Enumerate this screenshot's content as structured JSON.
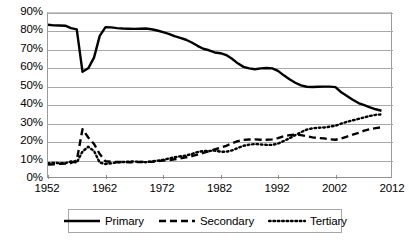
{
  "chart_data": {
    "type": "line",
    "title": "",
    "subtitle": "",
    "xlabel": "",
    "ylabel": "",
    "xlim": [
      1952,
      2012
    ],
    "ylim": [
      0,
      0.9
    ],
    "grid": true,
    "grid_axis": "y",
    "legend_position": "bottom",
    "y_tick_labels": [
      "90%",
      "80%",
      "70%",
      "60%",
      "50%",
      "40%",
      "30%",
      "20%",
      "10%",
      "0%"
    ],
    "y_tick_values": [
      0.9,
      0.8,
      0.7,
      0.6,
      0.5,
      0.4,
      0.3,
      0.2,
      0.1,
      0.0
    ],
    "x_tick_labels": [
      "1952",
      "1962",
      "1972",
      "1982",
      "1992",
      "2002",
      "2012"
    ],
    "x_tick_values": [
      1952,
      1962,
      1972,
      1982,
      1992,
      2002,
      2012
    ],
    "x": [
      1952,
      1953,
      1954,
      1955,
      1956,
      1957,
      1958,
      1959,
      1960,
      1961,
      1962,
      1963,
      1964,
      1965,
      1966,
      1967,
      1968,
      1969,
      1970,
      1971,
      1972,
      1973,
      1974,
      1975,
      1976,
      1977,
      1978,
      1979,
      1980,
      1981,
      1982,
      1983,
      1984,
      1985,
      1986,
      1987,
      1988,
      1989,
      1990,
      1991,
      1992,
      1993,
      1994,
      1995,
      1996,
      1997,
      1998,
      1999,
      2000,
      2001,
      2002,
      2003,
      2004,
      2005,
      2006,
      2007,
      2008,
      2009,
      2010
    ],
    "series": [
      {
        "name": "Primary",
        "style": "solid",
        "color": "#000000",
        "values": [
          0.836,
          0.833,
          0.832,
          0.831,
          0.818,
          0.811,
          0.581,
          0.6,
          0.658,
          0.776,
          0.823,
          0.822,
          0.818,
          0.816,
          0.815,
          0.814,
          0.815,
          0.816,
          0.812,
          0.805,
          0.796,
          0.787,
          0.775,
          0.765,
          0.755,
          0.74,
          0.722,
          0.706,
          0.698,
          0.686,
          0.682,
          0.672,
          0.652,
          0.627,
          0.608,
          0.6,
          0.595,
          0.6,
          0.602,
          0.6,
          0.586,
          0.562,
          0.541,
          0.522,
          0.508,
          0.5,
          0.499,
          0.5,
          0.501,
          0.501,
          0.498,
          0.47,
          0.45,
          0.43,
          0.412,
          0.4,
          0.388,
          0.378,
          0.37
        ]
      },
      {
        "name": "Secondary",
        "style": "dashed",
        "color": "#000000",
        "values": [
          0.078,
          0.08,
          0.082,
          0.084,
          0.087,
          0.1,
          0.27,
          0.225,
          0.19,
          0.135,
          0.096,
          0.093,
          0.092,
          0.092,
          0.091,
          0.091,
          0.092,
          0.093,
          0.093,
          0.096,
          0.1,
          0.102,
          0.107,
          0.112,
          0.118,
          0.124,
          0.132,
          0.142,
          0.15,
          0.16,
          0.17,
          0.18,
          0.193,
          0.205,
          0.212,
          0.214,
          0.215,
          0.213,
          0.213,
          0.215,
          0.222,
          0.232,
          0.238,
          0.24,
          0.238,
          0.232,
          0.226,
          0.222,
          0.22,
          0.215,
          0.213,
          0.22,
          0.23,
          0.24,
          0.25,
          0.262,
          0.27,
          0.276,
          0.28
        ]
      },
      {
        "name": "Tertiary",
        "style": "dotted",
        "color": "#000000",
        "values": [
          0.086,
          0.087,
          0.086,
          0.085,
          0.095,
          0.089,
          0.149,
          0.175,
          0.152,
          0.089,
          0.081,
          0.085,
          0.09,
          0.092,
          0.094,
          0.095,
          0.093,
          0.091,
          0.095,
          0.099,
          0.104,
          0.111,
          0.118,
          0.123,
          0.127,
          0.136,
          0.146,
          0.152,
          0.152,
          0.154,
          0.148,
          0.148,
          0.155,
          0.168,
          0.18,
          0.186,
          0.19,
          0.187,
          0.185,
          0.185,
          0.192,
          0.206,
          0.221,
          0.238,
          0.254,
          0.268,
          0.275,
          0.278,
          0.279,
          0.284,
          0.289,
          0.3,
          0.31,
          0.318,
          0.326,
          0.334,
          0.342,
          0.348,
          0.35
        ]
      }
    ],
    "legend": [
      {
        "label": "Primary",
        "style": "solid"
      },
      {
        "label": "Secondary",
        "style": "dashed"
      },
      {
        "label": "Tertiary",
        "style": "dotted"
      }
    ]
  }
}
